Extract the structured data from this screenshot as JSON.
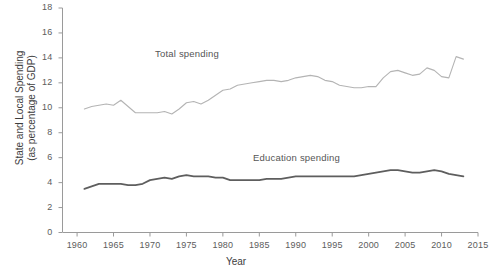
{
  "chart_data": {
    "type": "line",
    "title": "",
    "xlabel": "Year",
    "ylabel": "State and Local Spending (as percentage of GDP)",
    "ylabel_line1": "State and Local Spending",
    "ylabel_line2": "(as percentage of GDP)",
    "xlim": [
      1958,
      2015
    ],
    "ylim": [
      0,
      18
    ],
    "grid": false,
    "legend_position": "inline-annotations",
    "xticks": [
      1960,
      1965,
      1970,
      1975,
      1980,
      1985,
      1990,
      1995,
      2000,
      2005,
      2010,
      2015
    ],
    "yticks": [
      0,
      2,
      4,
      6,
      8,
      10,
      12,
      14,
      16,
      18
    ],
    "x": [
      1961,
      1962,
      1963,
      1964,
      1965,
      1966,
      1967,
      1968,
      1969,
      1970,
      1971,
      1972,
      1973,
      1974,
      1975,
      1976,
      1977,
      1978,
      1979,
      1980,
      1981,
      1982,
      1983,
      1984,
      1985,
      1986,
      1987,
      1988,
      1989,
      1990,
      1991,
      1992,
      1993,
      1994,
      1995,
      1996,
      1997,
      1998,
      1999,
      2000,
      2001,
      2002,
      2003,
      2004,
      2005,
      2006,
      2007,
      2008,
      2009,
      2010,
      2011,
      2012,
      2013
    ],
    "series": [
      {
        "name": "Total spending",
        "color": "#b4b4b4",
        "values": [
          9.9,
          10.1,
          10.2,
          10.3,
          10.2,
          10.6,
          10.1,
          9.6,
          9.6,
          9.6,
          9.6,
          9.7,
          9.5,
          9.9,
          10.4,
          10.5,
          10.3,
          10.6,
          11.0,
          11.4,
          11.5,
          11.8,
          11.9,
          12.0,
          12.1,
          12.2,
          12.2,
          12.1,
          12.2,
          12.4,
          12.5,
          12.6,
          12.5,
          12.2,
          12.1,
          11.8,
          11.7,
          11.6,
          11.6,
          11.7,
          11.7,
          12.4,
          12.9,
          13.0,
          12.8,
          12.6,
          12.7,
          13.2,
          13.0,
          12.5,
          12.4,
          14.1,
          13.9
        ]
      },
      {
        "name": "Education spending",
        "color": "#5e5e5e",
        "values": [
          3.5,
          3.7,
          3.9,
          3.9,
          3.9,
          3.9,
          3.8,
          3.8,
          3.9,
          4.2,
          4.3,
          4.4,
          4.3,
          4.5,
          4.6,
          4.5,
          4.5,
          4.5,
          4.4,
          4.4,
          4.2,
          4.2,
          4.2,
          4.2,
          4.2,
          4.3,
          4.3,
          4.3,
          4.4,
          4.5,
          4.5,
          4.5,
          4.5,
          4.5,
          4.5,
          4.5,
          4.5,
          4.5,
          4.6,
          4.7,
          4.8,
          4.9,
          5.0,
          5.0,
          4.9,
          4.8,
          4.8,
          4.9,
          5.0,
          4.9,
          4.7,
          4.6,
          4.5
        ]
      }
    ],
    "annotations": [
      {
        "text": "Total spending",
        "x": 1981,
        "y": 13.6
      },
      {
        "text": "Education spending",
        "x": 1995,
        "y": 6.3
      }
    ]
  }
}
